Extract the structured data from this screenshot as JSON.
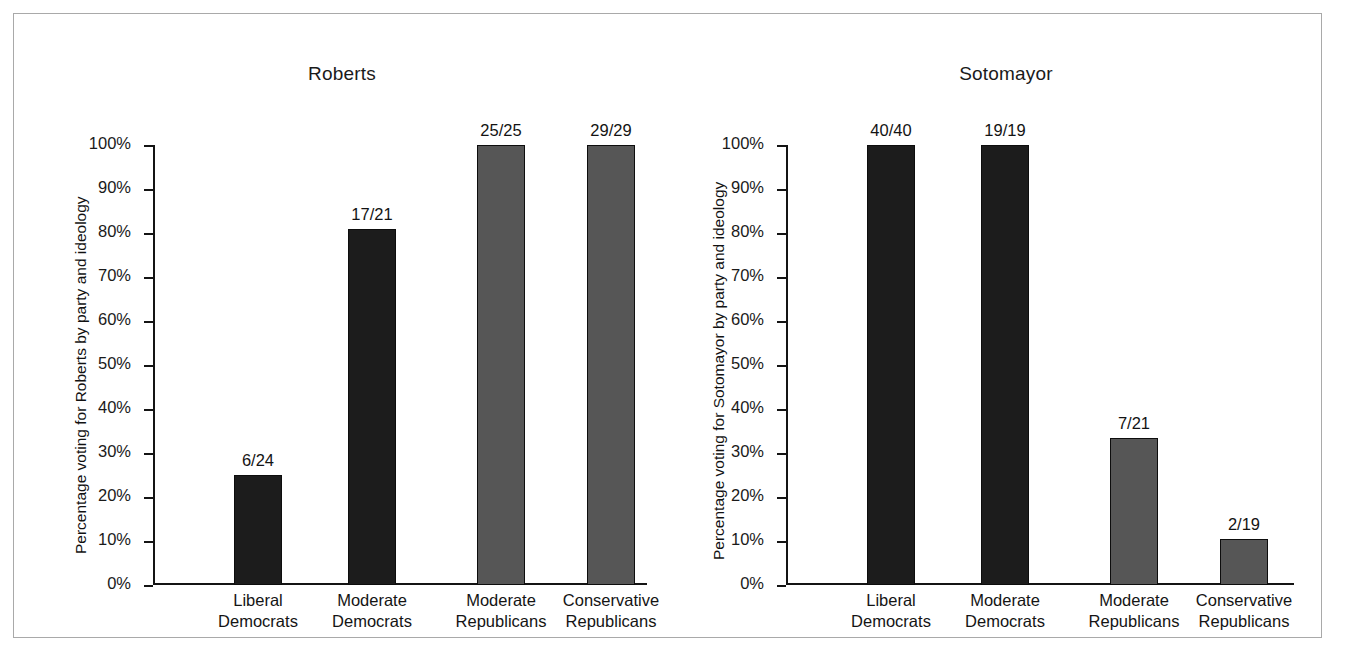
{
  "figure": {
    "panels": [
      {
        "title": "Roberts",
        "ylabel": "Percentage voting for Roberts by party and ideology",
        "categories": [
          {
            "line1": "Liberal",
            "line2": "Democrats"
          },
          {
            "line1": "Moderate",
            "line2": "Democrats"
          },
          {
            "line1": "Moderate",
            "line2": "Republicans"
          },
          {
            "line1": "Conservative",
            "line2": "Republicans"
          }
        ],
        "bars": [
          {
            "label": "6/24",
            "percent": 25.0,
            "group": "dem"
          },
          {
            "label": "17/21",
            "percent": 81.0,
            "group": "dem"
          },
          {
            "label": "25/25",
            "percent": 100.0,
            "group": "rep"
          },
          {
            "label": "29/29",
            "percent": 100.0,
            "group": "rep"
          }
        ]
      },
      {
        "title": "Sotomayor",
        "ylabel": "Percentage voting for Sotomayor by party and ideology",
        "categories": [
          {
            "line1": "Liberal",
            "line2": "Democrats"
          },
          {
            "line1": "Moderate",
            "line2": "Democrats"
          },
          {
            "line1": "Moderate",
            "line2": "Republicans"
          },
          {
            "line1": "Conservative",
            "line2": "Republicans"
          }
        ],
        "bars": [
          {
            "label": "40/40",
            "percent": 100.0,
            "group": "dem"
          },
          {
            "label": "19/19",
            "percent": 100.0,
            "group": "dem"
          },
          {
            "label": "7/21",
            "percent": 33.3,
            "group": "rep"
          },
          {
            "label": "2/19",
            "percent": 10.5,
            "group": "rep"
          }
        ]
      }
    ],
    "yticks": [
      "100%",
      "90%",
      "80%",
      "70%",
      "60%",
      "50%",
      "40%",
      "30%",
      "20%",
      "10%",
      "0%"
    ],
    "colors": {
      "democrat_bar": "#1c1c1c",
      "republican_bar": "#565656",
      "axis": "#141414",
      "frame": "#a9a9a9",
      "background": "#ffffff"
    }
  },
  "chart_data": [
    {
      "type": "bar",
      "title": "Roberts",
      "xlabel": "",
      "ylabel": "Percentage voting for Roberts by party and ideology",
      "ylim": [
        0,
        100
      ],
      "ytick_values": [
        0,
        10,
        20,
        30,
        40,
        50,
        60,
        70,
        80,
        90,
        100
      ],
      "ytick_labels": [
        "0%",
        "10%",
        "20%",
        "30%",
        "40%",
        "50%",
        "60%",
        "70%",
        "80%",
        "90%",
        "100%"
      ],
      "grid": false,
      "legend": "none",
      "categories": [
        "Liberal Democrats",
        "Moderate Democrats",
        "Moderate Republicans",
        "Conservative Republicans"
      ],
      "values": [
        25.0,
        81.0,
        100.0,
        100.0
      ],
      "data_labels": [
        "6/24",
        "17/21",
        "25/25",
        "29/29"
      ],
      "bar_colors": [
        "#1c1c1c",
        "#1c1c1c",
        "#565656",
        "#565656"
      ]
    },
    {
      "type": "bar",
      "title": "Sotomayor",
      "xlabel": "",
      "ylabel": "Percentage voting for Sotomayor by party and ideology",
      "ylim": [
        0,
        100
      ],
      "ytick_values": [
        0,
        10,
        20,
        30,
        40,
        50,
        60,
        70,
        80,
        90,
        100
      ],
      "ytick_labels": [
        "0%",
        "10%",
        "20%",
        "30%",
        "40%",
        "50%",
        "60%",
        "70%",
        "80%",
        "90%",
        "100%"
      ],
      "grid": false,
      "legend": "none",
      "categories": [
        "Liberal Democrats",
        "Moderate Democrats",
        "Moderate Republicans",
        "Conservative Republicans"
      ],
      "values": [
        100.0,
        100.0,
        33.3,
        10.5
      ],
      "data_labels": [
        "40/40",
        "19/19",
        "7/21",
        "2/19"
      ],
      "bar_colors": [
        "#1c1c1c",
        "#1c1c1c",
        "#565656",
        "#565656"
      ]
    }
  ]
}
